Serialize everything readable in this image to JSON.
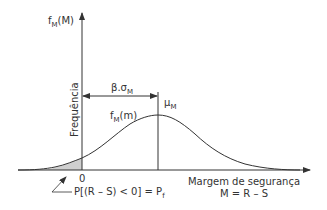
{
  "diagram": {
    "y_axis_label": "f",
    "y_axis_label_sub": "M",
    "y_axis_label_tail": "(M)",
    "y_axis_title": "Frequência",
    "x_axis_title_line1": "Margem de segurança",
    "x_axis_title_line2": "M = R – S",
    "origin_label": "0",
    "distance_label": "β.σ",
    "distance_label_sub": "M",
    "mean_label": "μ",
    "mean_label_sub": "M",
    "curve_label": "f",
    "curve_label_sub": "M",
    "curve_label_tail": "(m)",
    "failure_label": "P[(R – S) < 0] = P",
    "failure_label_sub": "f",
    "colors": {
      "line": "#333333",
      "shaded_area": "#cfcfcf"
    }
  }
}
